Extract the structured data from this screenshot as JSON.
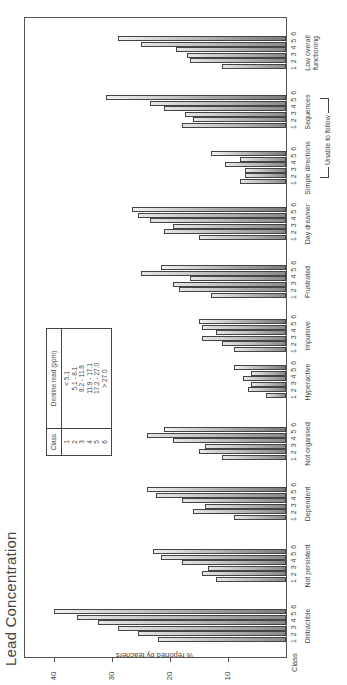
{
  "title": "Lead Concentration",
  "chart_data": {
    "type": "bar",
    "title": "Lead Concentration",
    "xlabel": "Class",
    "ylabel": "% reported by teachers",
    "ylim": [
      0,
      42
    ],
    "yticks": [
      10,
      20,
      30,
      40
    ],
    "orientation": "rotated 90° counter-clockwise on page",
    "categories": [
      "Distractible",
      "Not persistent",
      "Dependent",
      "Not organised",
      "Hyperactive",
      "Impulsive",
      "Frustrated",
      "Day dreamer",
      "Simple directions",
      "Sequences",
      "Low overall functioning"
    ],
    "class_labels": [
      "1",
      "2",
      "3",
      "4",
      "5",
      "6"
    ],
    "series": [
      {
        "name": "Class 1",
        "values": [
          22,
          12,
          9,
          11,
          3.5,
          9,
          13,
          15,
          8,
          18,
          11
        ]
      },
      {
        "name": "Class 2",
        "values": [
          25.5,
          14.5,
          16,
          15,
          6.5,
          11,
          18.5,
          21,
          7,
          16,
          16.5
        ]
      },
      {
        "name": "Class 3",
        "values": [
          29,
          13.5,
          14,
          14,
          6,
          14.5,
          19.5,
          19.5,
          7,
          17.5,
          17
        ]
      },
      {
        "name": "Class 4",
        "values": [
          32.5,
          18,
          18,
          19.5,
          7.5,
          12,
          16.5,
          23.5,
          10.5,
          21,
          19
        ]
      },
      {
        "name": "Class 5",
        "values": [
          36,
          21.5,
          22.5,
          24,
          6,
          14.5,
          25,
          25.5,
          8,
          23.5,
          25
        ]
      },
      {
        "name": "Class 6",
        "values": [
          40,
          23,
          24,
          21,
          9,
          15,
          21.5,
          26.5,
          13,
          31,
          29
        ]
      }
    ],
    "annotations": [
      {
        "text": "Unable to follow",
        "spans": [
          "Simple directions",
          "Sequences"
        ]
      }
    ],
    "legend": {
      "headers": [
        "Class",
        "Dentine lead (ppm)"
      ],
      "rows": [
        [
          "1",
          "< 5.1"
        ],
        [
          "2",
          "5.1 - 8.1"
        ],
        [
          "3",
          "8.2 - 11.8"
        ],
        [
          "4",
          "11.9 - 17.1"
        ],
        [
          "5",
          "17.2 - 27.0"
        ],
        [
          "6",
          "> 27.0"
        ]
      ],
      "position": "upper middle, inside plot"
    },
    "grid": false
  },
  "axis": {
    "ylabel": "% reported by teachers",
    "xlabel": "Class",
    "ticks": [
      "10",
      "20",
      "30",
      "40"
    ]
  },
  "groups": [
    {
      "label": "Distractible",
      "nums": "1 2 3 4 5 6"
    },
    {
      "label": "Not persistent",
      "nums": "1 2 3 4 5 6"
    },
    {
      "label": "Dependent",
      "nums": "1 2 3 4 5 6"
    },
    {
      "label": "Not organised",
      "nums": "1 2 3 4 5 6"
    },
    {
      "label": "Hyperactive",
      "nums": "1 2 3 4 5 6"
    },
    {
      "label": "Impulsive",
      "nums": "1 2 3 4 5 6"
    },
    {
      "label": "Frustrated",
      "nums": "1 2 3 4 5 6"
    },
    {
      "label": "Day dreamer",
      "nums": "1 2 3 4 5 6"
    },
    {
      "label": "Simple directions",
      "nums": "1 2 3 4 5 6"
    },
    {
      "label": "Sequences",
      "nums": "1 2 3 4 5 6"
    },
    {
      "label": "Low overall functioning",
      "nums": "1 2 3 4 5 6"
    }
  ],
  "bracket_label": "Unable to follow",
  "legend": {
    "header_class": "Class",
    "header_lead": "Dentine lead (ppm)",
    "classes": [
      "1",
      "2",
      "3",
      "4",
      "5",
      "6"
    ],
    "ranges": [
      "< 5.1",
      "5.1 - 8.1",
      "8.2 - 11.8",
      "11.9 - 17.1",
      "17.2 - 27.0",
      "> 27.0"
    ]
  }
}
